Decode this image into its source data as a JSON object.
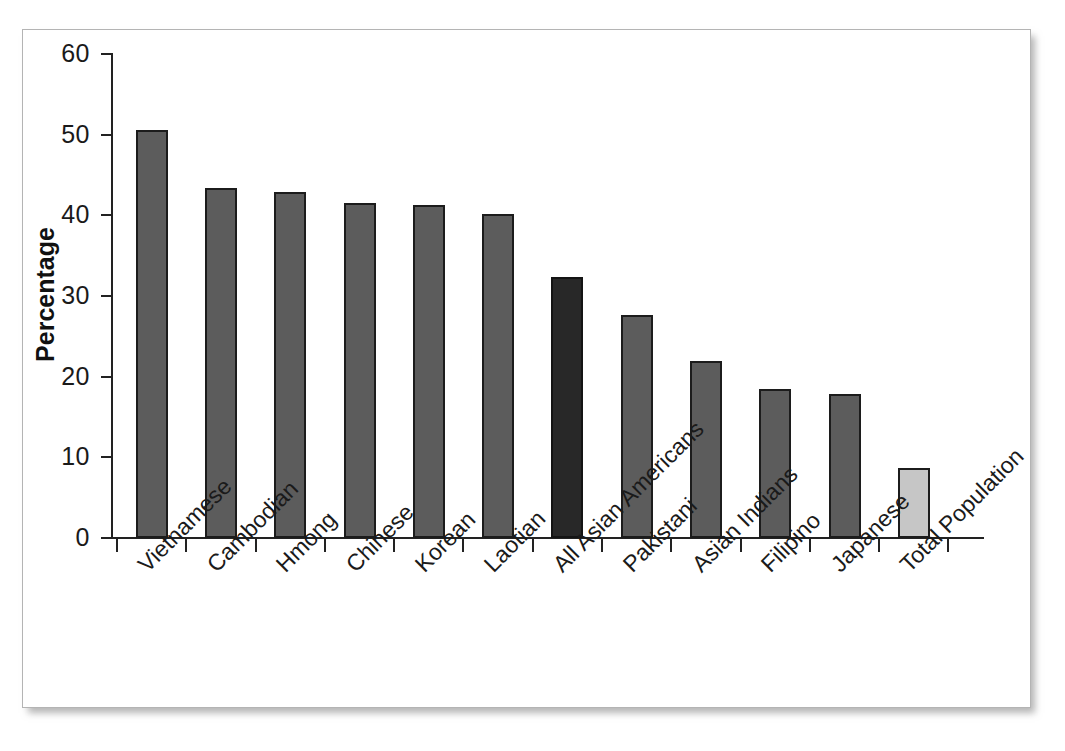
{
  "chart_data": {
    "type": "bar",
    "title": "",
    "xlabel": "",
    "ylabel": "Percentage",
    "ylim": [
      0,
      60
    ],
    "yticks": [
      0,
      10,
      20,
      30,
      40,
      50,
      60
    ],
    "ytick_labels": [
      "0",
      "10",
      "20",
      "30",
      "40",
      "50",
      "60"
    ],
    "grid": false,
    "legend": null,
    "categories": [
      "Vietnamese",
      "Cambodian",
      "Hmong",
      "Chinese",
      "Korean",
      "Laotian",
      "All Asian Americans",
      "Pakistani",
      "Asian Indians",
      "Filipino",
      "Japanese",
      "Total Population"
    ],
    "values": [
      50.6,
      43.4,
      42.9,
      41.5,
      41.3,
      40.2,
      32.4,
      27.7,
      22.0,
      18.5,
      17.9,
      8.7
    ],
    "bar_styles": [
      "standard",
      "standard",
      "standard",
      "standard",
      "standard",
      "standard",
      "highlight",
      "standard",
      "standard",
      "standard",
      "standard",
      "total"
    ],
    "colors": {
      "standard_fill": "#5c5c5c",
      "highlight_fill": "#282828",
      "total_fill": "#c6c6c6",
      "bar_outline": "#1c1c1c",
      "axis": "#222222",
      "text": "#1a1a1a",
      "background": "#ffffff",
      "card_border": "#b4b4b4"
    }
  }
}
